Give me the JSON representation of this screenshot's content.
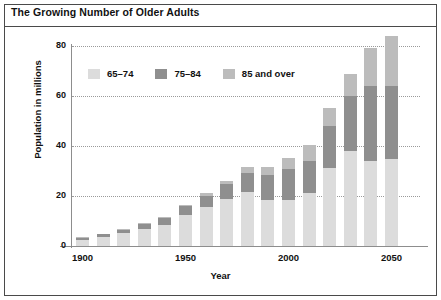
{
  "figure": {
    "title": "The Growing Number of Older Adults"
  },
  "chart_data": {
    "type": "bar",
    "stacked": true,
    "title": "The Growing Number of Older Adults",
    "xlabel": "Year",
    "ylabel": "Population in millions",
    "ylim": [
      0,
      80
    ],
    "yticks": [
      0,
      20,
      40,
      60,
      80
    ],
    "xticks": [
      1900,
      1950,
      2000,
      2050
    ],
    "grid": "horizontal-dotted",
    "legend_position": "inside-upper-left",
    "categories": [
      1900,
      1910,
      1920,
      1930,
      1940,
      1950,
      1960,
      1970,
      1980,
      1990,
      2000,
      2010,
      2020,
      2030,
      2040,
      2050
    ],
    "series": [
      {
        "name": "65–74",
        "color": "#dcdcdc",
        "values": [
          2.6,
          3.6,
          5.2,
          6.9,
          8.4,
          12.3,
          15.6,
          18.7,
          21.7,
          18.4,
          18.4,
          21.1,
          31.4,
          38.0,
          34.0,
          34.7
        ]
      },
      {
        "name": "75–84",
        "color": "#8f8f8f",
        "values": [
          0.8,
          1.1,
          1.4,
          2.0,
          2.7,
          3.6,
          4.6,
          6.1,
          7.7,
          10.1,
          12.4,
          13.1,
          16.6,
          22.0,
          29.9,
          29.4
        ]
      },
      {
        "name": "85 and over",
        "color": "#bcbcbc",
        "values": [
          0.1,
          0.2,
          0.2,
          0.3,
          0.4,
          0.6,
          0.9,
          1.4,
          2.2,
          3.0,
          4.3,
          6.1,
          7.2,
          9.0,
          15.4,
          19.8
        ]
      }
    ],
    "totals": [
      3.5,
      4.9,
      6.8,
      9.2,
      11.5,
      16.5,
      21.1,
      26.2,
      31.6,
      31.5,
      35.1,
      40.3,
      55.2,
      69.0,
      79.3,
      83.9
    ]
  },
  "legend": {
    "items": [
      {
        "label": "65–74",
        "color": "#dcdcdc"
      },
      {
        "label": "75–84",
        "color": "#8f8f8f"
      },
      {
        "label": "85 and over",
        "color": "#bcbcbc"
      }
    ]
  },
  "colors": {
    "frame": "#4a4a4a",
    "axis": "#8d8d8d",
    "grid": "#9a9a9a",
    "text": "#111111",
    "background": "#ffffff"
  }
}
